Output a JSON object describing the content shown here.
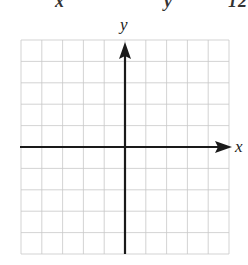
{
  "header": {
    "equation_fragment": "          x                  y          12"
  },
  "graph": {
    "x_label": "x",
    "y_label": "y",
    "grid_columns": 10,
    "grid_rows": 10,
    "grid_color": "#c8c8c8",
    "axis_color": "#1a1a1a"
  }
}
